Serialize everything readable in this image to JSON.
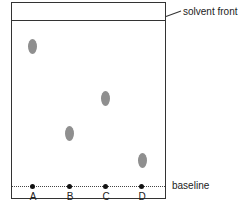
{
  "labels": {
    "solvent_front": "solvent front",
    "baseline": "baseline"
  },
  "lanes": [
    {
      "label": "A",
      "spot_x": 32,
      "spot_y": 47
    },
    {
      "label": "B",
      "spot_x": 69,
      "spot_y": 134
    },
    {
      "label": "C",
      "spot_x": 105,
      "spot_y": 99
    },
    {
      "label": "D",
      "spot_x": 142,
      "spot_y": 161
    }
  ],
  "colors": {
    "spot": "#8f8f8f",
    "line": "#333333"
  }
}
